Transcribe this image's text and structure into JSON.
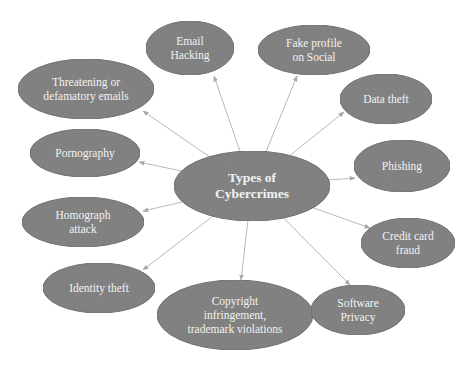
{
  "diagram": {
    "title": "Types of Cybercrimes",
    "colors": {
      "node_fill": "#7d7d7d",
      "node_stroke": "#6a6a6a",
      "edge": "#b8b8b8",
      "text": "#f2f2f2",
      "background": "#ffffff"
    },
    "center": {
      "id": "center",
      "label": "Types of\nCybercrimes",
      "cx": 252,
      "cy": 186,
      "rx": 78,
      "ry": 35
    },
    "nodes": [
      {
        "id": "email-hacking",
        "label": "Email\nHacking",
        "cx": 190,
        "cy": 48,
        "rx": 44,
        "ry": 27,
        "ax": 214,
        "ay": 76
      },
      {
        "id": "fake-profile",
        "label": "Fake profile\non Social",
        "cx": 314,
        "cy": 50,
        "rx": 56,
        "ry": 25,
        "ax": 297,
        "ay": 76
      },
      {
        "id": "threatening-emails",
        "label": "Threatening or\ndefamatory emails",
        "cx": 86,
        "cy": 89,
        "rx": 68,
        "ry": 30,
        "ax": 143,
        "ay": 111
      },
      {
        "id": "data-theft",
        "label": "Data theft",
        "cx": 386,
        "cy": 99,
        "rx": 46,
        "ry": 25,
        "ax": 344,
        "ay": 112
      },
      {
        "id": "pornography",
        "label": "Pornography",
        "cx": 85,
        "cy": 153,
        "rx": 55,
        "ry": 24,
        "ax": 139,
        "ay": 162
      },
      {
        "id": "phishing",
        "label": "Phishing",
        "cx": 402,
        "cy": 166,
        "rx": 48,
        "ry": 26,
        "ax": 355,
        "ay": 178
      },
      {
        "id": "homograph-attack",
        "label": "Homograph\nattack",
        "cx": 83,
        "cy": 222,
        "rx": 61,
        "ry": 25,
        "ax": 143,
        "ay": 211
      },
      {
        "id": "credit-card-fraud",
        "label": "Credit card\nfraud",
        "cx": 408,
        "cy": 243,
        "rx": 47,
        "ry": 25,
        "ax": 370,
        "ay": 228
      },
      {
        "id": "identity-theft",
        "label": "Identity theft",
        "cx": 99,
        "cy": 288,
        "rx": 56,
        "ry": 25,
        "ax": 143,
        "ay": 270
      },
      {
        "id": "copyright",
        "label": "Copyright\ninfringement,\ntrademark violations",
        "cx": 235,
        "cy": 315,
        "rx": 78,
        "ry": 35,
        "ax": 241,
        "ay": 280
      },
      {
        "id": "software-privacy",
        "label": "Software\nPrivacy",
        "cx": 358,
        "cy": 310,
        "rx": 47,
        "ry": 25,
        "ax": 350,
        "ay": 285
      }
    ],
    "edges_from": "center"
  }
}
